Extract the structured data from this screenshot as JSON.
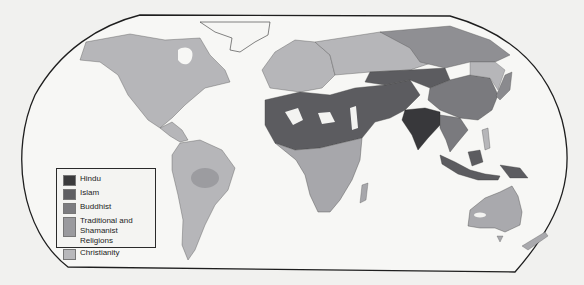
{
  "map": {
    "subject": "World religions",
    "background_color": "#f1f1ef",
    "outline_color": "#1e1e1e",
    "regions": [
      {
        "name": "north-america",
        "religion": "Christianity",
        "color": "#b6b6b9"
      },
      {
        "name": "south-america",
        "religion": "Christianity",
        "color": "#b6b6b9"
      },
      {
        "name": "amazon-interior",
        "religion": "Traditional and Shamanist Religions",
        "color": "#9c9ca0"
      },
      {
        "name": "europe",
        "religion": "Christianity",
        "color": "#b6b6b9"
      },
      {
        "name": "russia-west",
        "religion": "Christianity",
        "color": "#b6b6b9"
      },
      {
        "name": "siberia",
        "religion": "Traditional and Shamanist Religions",
        "color": "#8f8f93"
      },
      {
        "name": "north-africa-middle-east",
        "religion": "Islam",
        "color": "#5c5c60"
      },
      {
        "name": "sub-saharan-africa",
        "religion": "Christianity",
        "color": "#a7a7ab"
      },
      {
        "name": "central-asia",
        "religion": "Islam",
        "color": "#5c5c60"
      },
      {
        "name": "china",
        "religion": "Buddhist",
        "color": "#7a7a7e"
      },
      {
        "name": "india",
        "religion": "Hindu",
        "color": "#38383b"
      },
      {
        "name": "southeast-asia",
        "religion": "Buddhist",
        "color": "#7a7a7e"
      },
      {
        "name": "indonesia",
        "religion": "Islam",
        "color": "#5c5c60"
      },
      {
        "name": "australia",
        "religion": "Christianity",
        "color": "#a9a9ad"
      },
      {
        "name": "new-zealand",
        "religion": "Christianity",
        "color": "#a9a9ad"
      },
      {
        "name": "greenland",
        "religion": "",
        "color": "#f6f6f4"
      },
      {
        "name": "japan",
        "religion": "Buddhist",
        "color": "#8a8a8e"
      }
    ]
  },
  "legend": {
    "items": [
      {
        "label": "Hindu",
        "color": "#3a3a3c"
      },
      {
        "label": "Islam",
        "color": "#5e5e62"
      },
      {
        "label": "Buddhist",
        "color": "#7c7c80"
      },
      {
        "label": "Traditional and Shamanist Religions",
        "color": "#9a9a9e"
      },
      {
        "label": "Christianity",
        "color": "#b8b8bb"
      }
    ]
  }
}
